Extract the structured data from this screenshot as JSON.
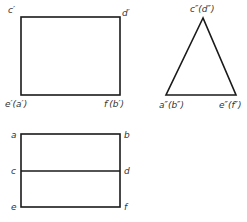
{
  "front_view": {
    "shape": "rectangle",
    "labels": {
      "top_left": "c′",
      "top_right": "d′",
      "bottom_left": "e′(a′)",
      "bottom_right": "f′(b′)"
    }
  },
  "side_view": {
    "shape": "triangle",
    "labels": {
      "apex": "c″(d″)",
      "bottom_left": "a″(b″)",
      "bottom_right": "e″(f″)"
    }
  },
  "top_view": {
    "shape": "rectangle-with-midline",
    "labels": {
      "top_left": "a",
      "top_right": "b",
      "mid_left": "c",
      "mid_right": "d",
      "bottom_left": "e",
      "bottom_right": "f"
    }
  },
  "colors": {
    "line": "#1a1a1a",
    "label": "#333333",
    "background": "#ffffff"
  }
}
